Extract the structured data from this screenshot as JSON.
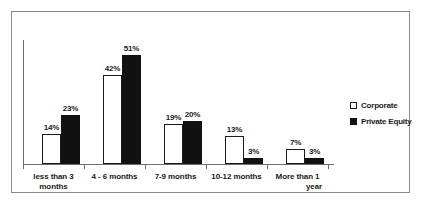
{
  "chart_data": {
    "type": "bar",
    "title": "",
    "subtitle": "",
    "xlabel": "",
    "ylabel": "",
    "ylim": [
      0,
      55
    ],
    "grid": false,
    "legend_position": "right",
    "categories": [
      "less than 3 months",
      "4 - 6 months",
      "7-9 months",
      "10-12 months",
      "More than 1 year"
    ],
    "category_lines": [
      [
        "less than 3",
        "months"
      ],
      [
        "4 - 6 months",
        ""
      ],
      [
        "7-9 months",
        ""
      ],
      [
        "10-12 months",
        ""
      ],
      [
        "More than 1",
        "year"
      ]
    ],
    "series": [
      {
        "name": "Corporate",
        "color": "#ffffff",
        "edge_color": "#1a1a1a",
        "values": [
          14,
          42,
          19,
          13,
          7
        ],
        "labels": [
          "14%",
          "42%",
          "19%",
          "13%",
          "7%"
        ]
      },
      {
        "name": "Private Equity",
        "color": "#111111",
        "edge_color": "#111111",
        "values": [
          23,
          51,
          20,
          3,
          3
        ],
        "labels": [
          "23%",
          "51%",
          "20%",
          "3%",
          "3%"
        ]
      }
    ]
  },
  "legend": {
    "items": [
      {
        "label": "Corporate",
        "marker": "open-square-marker"
      },
      {
        "label": "Private Equity",
        "marker": "filled-square-marker"
      }
    ]
  },
  "frame": {
    "border_color": "#8a8a8a",
    "background": "#ffffff"
  }
}
